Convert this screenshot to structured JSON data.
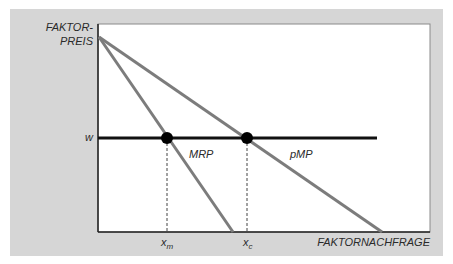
{
  "diagram": {
    "y_axis_label_line1": "FAKTOR-",
    "y_axis_label_line2": "PREIS",
    "x_axis_label": "FAKTORNACHFRAGE",
    "wage_label": "w",
    "curves": [
      {
        "name": "MRP",
        "label": "MRP"
      },
      {
        "name": "pMP",
        "label": "pMP"
      }
    ],
    "points": [
      {
        "label": "x",
        "subscript": "m"
      },
      {
        "label": "x",
        "subscript": "c"
      }
    ]
  },
  "colors": {
    "panel_background": "#d6d6d6",
    "plot_background": "#ffffff",
    "curve_color": "#7c7c7c",
    "wage_line_color": "#111111",
    "dot_color": "#000000"
  }
}
